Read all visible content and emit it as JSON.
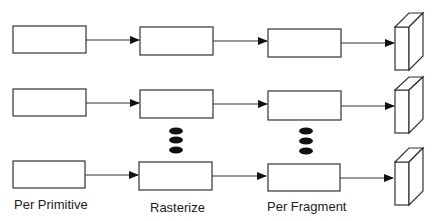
{
  "diagram": {
    "type": "parallel-pipeline",
    "rows": 3,
    "stages": [
      {
        "id": "per-primitive",
        "label": "Per Primitive"
      },
      {
        "id": "rasterize",
        "label": "Rasterize"
      },
      {
        "id": "per-fragment",
        "label": "Per Fragment"
      },
      {
        "id": "output",
        "label": ""
      }
    ],
    "ellipsis_marks": [
      "rasterize",
      "per-fragment"
    ],
    "colors": {
      "stroke": "#333333",
      "background": "#ffffff",
      "dots": "#111111"
    }
  }
}
